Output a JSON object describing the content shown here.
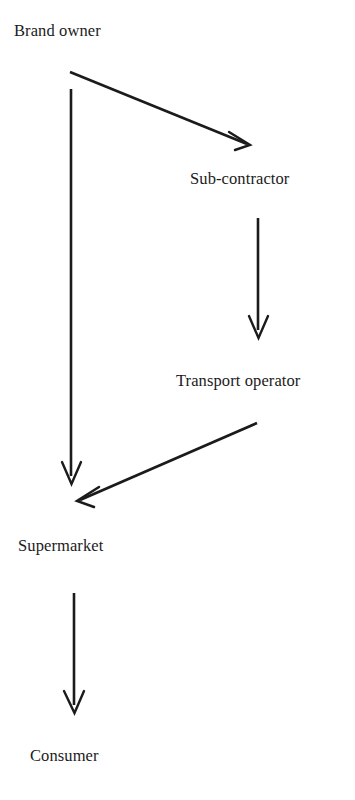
{
  "diagram": {
    "type": "flow-diagram",
    "background_color": "#ffffff",
    "ink_color": "#1b1b1b",
    "nodes": [
      {
        "id": "brand-owner",
        "label": "Brand owner",
        "x": 14,
        "y": 22
      },
      {
        "id": "sub-contractor",
        "label": "Sub-contractor",
        "x": 190,
        "y": 170
      },
      {
        "id": "transport-operator",
        "label": "Transport operator",
        "x": 176,
        "y": 372
      },
      {
        "id": "supermarket",
        "label": "Supermarket",
        "x": 18,
        "y": 537
      },
      {
        "id": "consumer",
        "label": "Consumer",
        "x": 30,
        "y": 747
      }
    ],
    "edges": [
      {
        "id": "brand-owner-to-sub-contractor",
        "from": "brand-owner",
        "to": "sub-contractor",
        "shape": "diagonal",
        "from_point": [
          70,
          72
        ],
        "to_point": [
          250,
          145
        ]
      },
      {
        "id": "brand-owner-to-supermarket",
        "from": "brand-owner",
        "to": "supermarket",
        "shape": "vertical",
        "from_point": [
          71,
          89
        ],
        "to_point": [
          71,
          484
        ]
      },
      {
        "id": "sub-contractor-to-transport-operator",
        "from": "sub-contractor",
        "to": "transport-operator",
        "shape": "vertical",
        "from_point": [
          258,
          218
        ],
        "to_point": [
          258,
          338
        ]
      },
      {
        "id": "transport-operator-to-supermarket",
        "from": "transport-operator",
        "to": "supermarket",
        "shape": "diagonal",
        "from_point": [
          257,
          423
        ],
        "to_point": [
          77,
          501
        ]
      },
      {
        "id": "supermarket-to-consumer",
        "from": "supermarket",
        "to": "consumer",
        "shape": "vertical",
        "from_point": [
          74,
          593
        ],
        "to_point": [
          74,
          713
        ]
      }
    ]
  }
}
